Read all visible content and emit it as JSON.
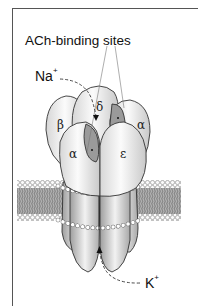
{
  "figure": {
    "title_label": "ACh-binding sites",
    "ions": {
      "sodium": {
        "symbol": "Na",
        "charge": "+"
      },
      "potassium": {
        "symbol": "K",
        "charge": "+"
      }
    },
    "subunits": [
      {
        "id": "beta",
        "label": "β"
      },
      {
        "id": "delta",
        "label": "δ"
      },
      {
        "id": "alpha-right",
        "label": "α"
      },
      {
        "id": "alpha-left",
        "label": "α"
      },
      {
        "id": "epsilon",
        "label": "ε"
      }
    ],
    "colors": {
      "frame": "#555555",
      "subunit_fill": "#f4f4f4",
      "binding_site": "#9a9a9a",
      "membrane_core": "#7a7a7a",
      "outline": "#333333"
    }
  }
}
